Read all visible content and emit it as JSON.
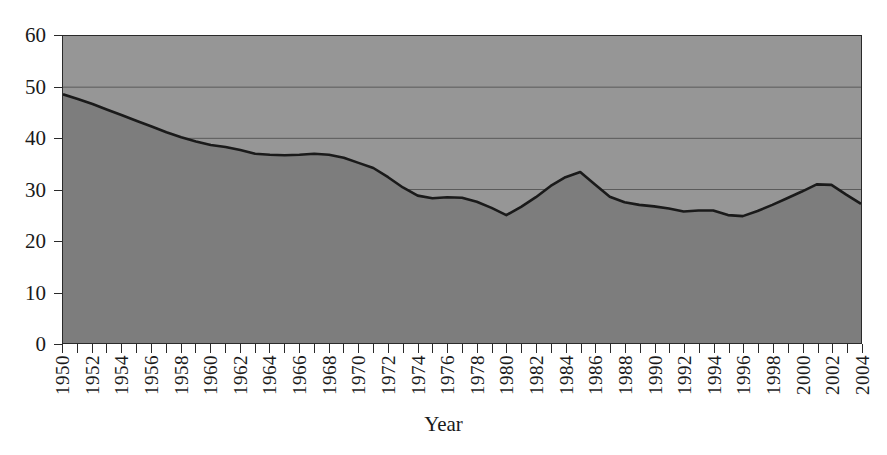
{
  "chart_data": {
    "type": "area",
    "title": "",
    "subtitle": "",
    "xlabel": "Year",
    "ylabel": "",
    "xlim": [
      1950,
      2004
    ],
    "ylim": [
      0,
      60
    ],
    "grid": true,
    "legend": null,
    "y_ticks": [
      0,
      10,
      20,
      30,
      40,
      50,
      60
    ],
    "x_tick_labels": [
      "1950",
      "1952",
      "1954",
      "1956",
      "1958",
      "1960",
      "1962",
      "1964",
      "1966",
      "1968",
      "1970",
      "1972",
      "1974",
      "1976",
      "1978",
      "1980",
      "1982",
      "1984",
      "1986",
      "1988",
      "1990",
      "1992",
      "1994",
      "1996",
      "1998",
      "2000",
      "2002",
      "2004"
    ],
    "x_tick_step_labeled": 2,
    "x_tick_step_minor": 1,
    "series": [
      {
        "name": "value",
        "x": [
          1950,
          1951,
          1952,
          1953,
          1954,
          1955,
          1956,
          1957,
          1958,
          1959,
          1960,
          1961,
          1962,
          1963,
          1964,
          1965,
          1966,
          1967,
          1968,
          1969,
          1970,
          1971,
          1972,
          1973,
          1974,
          1975,
          1976,
          1977,
          1978,
          1979,
          1980,
          1981,
          1982,
          1983,
          1984,
          1985,
          1986,
          1987,
          1988,
          1989,
          1990,
          1991,
          1992,
          1993,
          1994,
          1995,
          1996,
          1997,
          1998,
          1999,
          2000,
          2001,
          2002,
          2003,
          2004
        ],
        "values": [
          48.6,
          47.7,
          46.7,
          45.6,
          44.5,
          43.4,
          42.3,
          41.2,
          40.2,
          39.4,
          38.7,
          38.3,
          37.7,
          37.0,
          36.8,
          36.7,
          36.8,
          37.0,
          36.8,
          36.2,
          35.2,
          34.2,
          32.4,
          30.4,
          28.8,
          28.3,
          28.5,
          28.4,
          27.6,
          26.4,
          25.0,
          26.6,
          28.5,
          30.7,
          32.4,
          33.4,
          31.0,
          28.6,
          27.5,
          27.0,
          26.7,
          26.3,
          25.7,
          25.9,
          25.9,
          25.0,
          24.8,
          25.8,
          27.0,
          28.3,
          29.6,
          31.0,
          30.9,
          29.0,
          27.2
        ]
      }
    ]
  },
  "style": {
    "plot_upper_fill": "#969696",
    "plot_lower_fill": "#7d7d7d",
    "line_color": "#1a1a1a",
    "gridline_color": "#5a5a5a",
    "axis_color": "#2a2a2a",
    "page_background": "#ffffff"
  }
}
